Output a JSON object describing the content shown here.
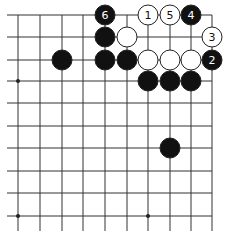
{
  "board": {
    "cols_x": [
      18,
      40,
      62,
      83,
      105,
      127,
      148,
      170,
      191,
      212
    ],
    "rows_y": [
      15,
      37,
      60,
      81,
      103,
      126,
      148,
      171,
      193,
      216
    ],
    "h_line_x_start": 7,
    "h_line_x_end": 212,
    "v_line_y_start": 15,
    "v_line_y_end": 231,
    "line_color": "#333333",
    "star_points": [
      [
        0,
        3
      ],
      [
        0,
        9
      ],
      [
        6,
        9
      ]
    ]
  },
  "stones": [
    {
      "col": 4,
      "row": 0,
      "color": "black",
      "label": "6"
    },
    {
      "col": 6,
      "row": 0,
      "color": "white",
      "label": "1"
    },
    {
      "col": 7,
      "row": 0,
      "color": "white",
      "label": "5"
    },
    {
      "col": 8,
      "row": 0,
      "color": "black",
      "label": "4"
    },
    {
      "col": 4,
      "row": 1,
      "color": "black",
      "label": ""
    },
    {
      "col": 5,
      "row": 1,
      "color": "white",
      "label": ""
    },
    {
      "col": 9,
      "row": 1,
      "color": "white",
      "label": "3"
    },
    {
      "col": 2,
      "row": 2,
      "color": "black",
      "label": ""
    },
    {
      "col": 4,
      "row": 2,
      "color": "black",
      "label": ""
    },
    {
      "col": 5,
      "row": 2,
      "color": "black",
      "label": ""
    },
    {
      "col": 6,
      "row": 2,
      "color": "white",
      "label": ""
    },
    {
      "col": 7,
      "row": 2,
      "color": "white",
      "label": ""
    },
    {
      "col": 8,
      "row": 2,
      "color": "white",
      "label": ""
    },
    {
      "col": 9,
      "row": 2,
      "color": "black",
      "label": "2"
    },
    {
      "col": 6,
      "row": 3,
      "color": "black",
      "label": ""
    },
    {
      "col": 7,
      "row": 3,
      "color": "black",
      "label": ""
    },
    {
      "col": 8,
      "row": 3,
      "color": "black",
      "label": ""
    },
    {
      "col": 7,
      "row": 6,
      "color": "black",
      "label": ""
    }
  ]
}
